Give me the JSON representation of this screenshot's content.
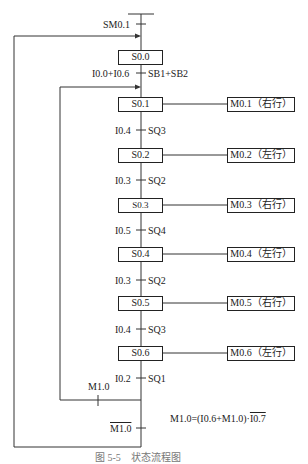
{
  "diagram": {
    "type": "sequential function chart",
    "initial_transition": "SM0.1",
    "steps": [
      {
        "id": "S0.0",
        "output": null
      },
      {
        "id": "S0.1",
        "output": "M0.1（右行）"
      },
      {
        "id": "S0.2",
        "output": "M0.2（左行）"
      },
      {
        "id": "S0.3",
        "output": "M0.3（右行）"
      },
      {
        "id": "S0.4",
        "output": "M0.4（左行）"
      },
      {
        "id": "S0.5",
        "output": "M0.5（右行）"
      },
      {
        "id": "S0.6",
        "output": "M0.6（左行）"
      }
    ],
    "transitions": [
      {
        "left": "I0.0+I0.6",
        "right": "SB1+SB2"
      },
      {
        "left": "I0.4",
        "right": "SQ3"
      },
      {
        "left": "I0.3",
        "right": "SQ2"
      },
      {
        "left": "I0.5",
        "right": "SQ4"
      },
      {
        "left": "I0.3",
        "right": "SQ2"
      },
      {
        "left": "I0.4",
        "right": "SQ3"
      },
      {
        "left": "I0.2",
        "right": "SQ1"
      }
    ],
    "loop_inner_condition": "M1.0",
    "loop_outer_condition": "M1.0",
    "equation": "M1.0=(I0.6+M1.0)·",
    "equation_negated_term": "I0.7",
    "caption": "图 5-5　状态流程图"
  }
}
